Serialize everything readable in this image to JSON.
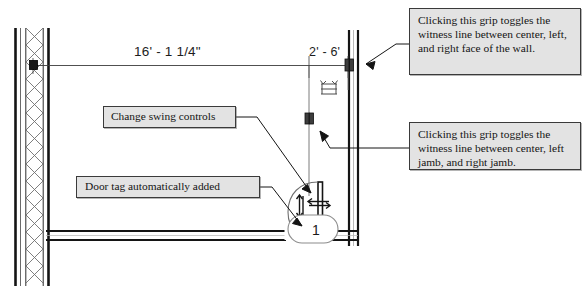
{
  "drawing": {
    "title": "Door placement plan view with annotation callouts",
    "dimensions": {
      "main_run": "16' - 1 1/4\"",
      "door_offset": "2' - 6'"
    },
    "door_tag": {
      "number": "1"
    },
    "colors": {
      "callout_fill": "#e3e3e3",
      "callout_border": "#3a3a3a",
      "line": "#1a1a1a",
      "thin_line": "#555555",
      "background": "#ffffff"
    }
  },
  "callouts": [
    {
      "id": "grip-wall",
      "text": "Clicking this grip toggles the witness line between center, left, and right face of the wall."
    },
    {
      "id": "grip-jamb",
      "text": "Clicking this grip toggles the witness line between center, left jamb, and right jamb."
    },
    {
      "id": "swing",
      "text": "Change swing controls"
    },
    {
      "id": "doortag",
      "text": "Door tag automatically added"
    }
  ],
  "controls": {
    "flip_vertical_icon": "flip-vertical-arrows",
    "flip_horizontal_icon": "flip-horizontal-arrows",
    "dimension_flip_icon": "dimension-flip",
    "grip_wall_icon": "grip-square",
    "grip_jamb_icon": "grip-square",
    "grip_left_wall_icon": "grip-square"
  }
}
